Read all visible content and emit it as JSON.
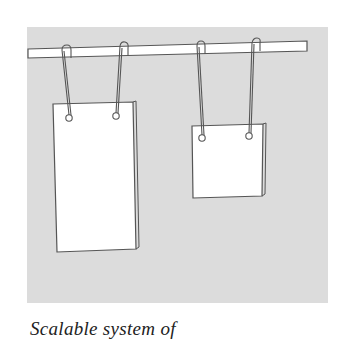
{
  "figure": {
    "panel_color": "#dcdcdc",
    "rail_color": "#ffffff",
    "outline_color": "#555555",
    "pad_color": "#ffffff",
    "pads": [
      {
        "name": "tall-pad",
        "label": "Tall notepad"
      },
      {
        "name": "short-pad",
        "label": "Short notepad"
      }
    ],
    "caption": "Scalable system of"
  }
}
